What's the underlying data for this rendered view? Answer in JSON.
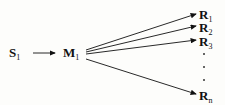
{
  "diagram": {
    "source": {
      "base": "S",
      "sub": "1"
    },
    "intermediate": {
      "base": "M",
      "sub": "1"
    },
    "products": [
      {
        "base": "R",
        "sub": "1"
      },
      {
        "base": "R",
        "sub": "2"
      },
      {
        "base": "R",
        "sub": "3"
      },
      {
        "base": "R",
        "sub": "n"
      }
    ],
    "ellipsis": "..."
  }
}
